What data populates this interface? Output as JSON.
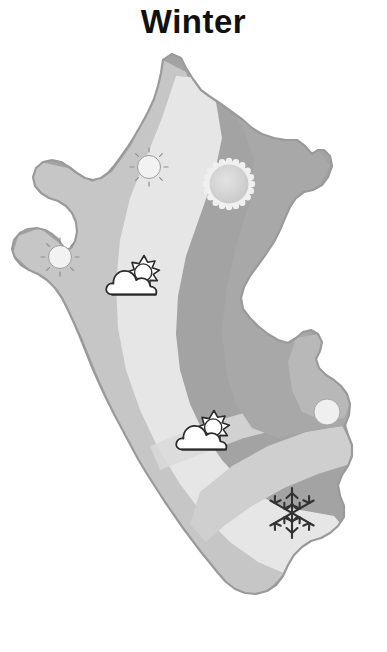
{
  "page": {
    "title": "Winter",
    "background_color": "#ffffff",
    "width": 387,
    "height": 652
  },
  "map": {
    "name": "peru-climate-map",
    "season": "Winter",
    "outline_color": "#9a9a9a",
    "zones": [
      {
        "id": "amazon-east",
        "label": "Eastern Amazon zone",
        "color": "#a3a3a3"
      },
      {
        "id": "coastal-west",
        "label": "Western coastal zone",
        "color": "#c6c6c6"
      },
      {
        "id": "highland-central",
        "label": "Central highland zone",
        "color": "#e6e6e6"
      },
      {
        "id": "southern-band",
        "label": "Southern altiplano band",
        "color": "#cfcfcf"
      }
    ]
  },
  "icons": [
    {
      "id": "sun-north",
      "type": "sun-rays",
      "name": "sun-icon",
      "label": "Sunny",
      "x": 129,
      "y": 101,
      "size": 40,
      "fill": "#f2f2f2",
      "stroke": "#8d8d8d"
    },
    {
      "id": "sun-northeast",
      "type": "sun-scalloped",
      "name": "bright-sun-icon",
      "label": "Bright sun",
      "x": 203,
      "y": 112,
      "size": 52,
      "fill": "#d6d6d6",
      "stroke": "#efefef"
    },
    {
      "id": "sun-west",
      "type": "sun-rays",
      "name": "sun-icon",
      "label": "Sunny",
      "x": 40,
      "y": 191,
      "size": 40,
      "fill": "#f2f2f2",
      "stroke": "#8d8d8d"
    },
    {
      "id": "cloudsun-north-highland",
      "type": "cloud-sun",
      "name": "partly-cloudy-icon",
      "label": "Partly cloudy",
      "x": 104,
      "y": 204,
      "size": 62,
      "fill": "#ffffff",
      "stroke": "#2b2b2b"
    },
    {
      "id": "sun-east-edge",
      "type": "sun-plain",
      "name": "sun-icon",
      "label": "Sunny",
      "x": 310,
      "y": 349,
      "size": 34,
      "fill": "#efefef",
      "stroke": "#a6a6a6"
    },
    {
      "id": "cloudsun-south-central",
      "type": "cloud-sun",
      "name": "partly-cloudy-icon",
      "label": "Partly cloudy",
      "x": 174,
      "y": 359,
      "size": 62,
      "fill": "#ffffff",
      "stroke": "#2b2b2b"
    },
    {
      "id": "snow-southeast",
      "type": "snowflake",
      "name": "snowflake-icon",
      "label": "Snow",
      "x": 263,
      "y": 438,
      "size": 58,
      "fill": "none",
      "stroke": "#333333"
    }
  ]
}
